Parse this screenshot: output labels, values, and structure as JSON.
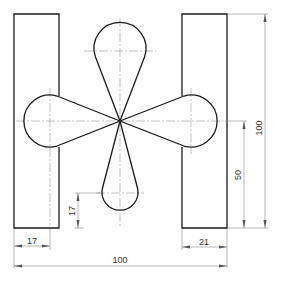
{
  "drawing": {
    "type": "technical-drawing",
    "description": "Flat plate outline with two rectangular side bars and a four-petal teardrop shape in the center",
    "dimensions": {
      "overall_width": "100",
      "overall_height": "100",
      "center_height": "50",
      "left_bar_width": "17",
      "right_bar_width": "21",
      "bottom_petal_offset": "17"
    },
    "colors": {
      "outline": "#1a1a1a",
      "center_line": "#9a9a9a",
      "dimension_line": "#8a8a8a"
    }
  }
}
